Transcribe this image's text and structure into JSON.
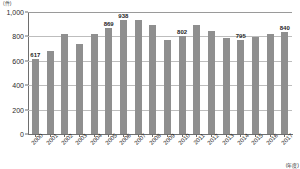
{
  "chart_data": {
    "type": "bar",
    "title": "",
    "subtitle": "",
    "unit_label": "(件)",
    "xlabel": "(年度)",
    "ylabel": "",
    "ylim": [
      0,
      1000
    ],
    "grid": true,
    "legend": "none",
    "categories": [
      "2000",
      "2001",
      "2002",
      "2003",
      "2004",
      "2005",
      "2006",
      "2007",
      "2008",
      "2009",
      "2010",
      "2011",
      "2012",
      "2013",
      "2014",
      "2015",
      "2016",
      "2017"
    ],
    "values": [
      617,
      683,
      818,
      740,
      820,
      869,
      938,
      933,
      890,
      767,
      802,
      897,
      843,
      789,
      767,
      795,
      823,
      840
    ],
    "labeled_points": [
      {
        "category": "2000",
        "value": 617,
        "label": "617"
      },
      {
        "category": "2005",
        "value": 869,
        "label": "869"
      },
      {
        "category": "2006",
        "value": 938,
        "label": "938"
      },
      {
        "category": "2010",
        "value": 802,
        "label": "802"
      },
      {
        "category": "2014",
        "value": 795,
        "label": "795"
      },
      {
        "category": "2017",
        "value": 840,
        "label": "840"
      }
    ],
    "yticks": [
      "0",
      "200",
      "400",
      "600",
      "800",
      "1,000"
    ],
    "ytick_values": [
      0,
      200,
      400,
      600,
      800,
      1000
    ],
    "colors": {
      "bar": "#8f8f8f",
      "grid": "#bdbdbd",
      "axis": "#6e6e6e",
      "text": "#1f1f1f",
      "background": "#ffffff"
    }
  }
}
